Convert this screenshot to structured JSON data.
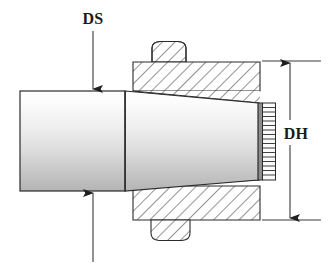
{
  "drawing": {
    "type": "engineering-cross-section",
    "title_visible": false,
    "background_color": "#ffffff",
    "line_color": "#2b2b2b",
    "hatch_color": "#4a4a4a",
    "shaft_fill_top": "#fdfdfd",
    "shaft_fill_bottom": "#b9b9b9",
    "labels": {
      "shaft_diameter": "DS",
      "hub_diameter": "DH"
    },
    "annotations": [
      {
        "name": "DS",
        "text": "DS",
        "description": "shaft diameter dimension with arrows pointing to top and bottom of shaft",
        "x": 93,
        "y": 18
      },
      {
        "name": "DH",
        "text": "DH",
        "description": "hub / housing diameter dimension with double arrow at right",
        "x": 296,
        "y": 133
      }
    ],
    "geometry": {
      "shaft_cylinder": {
        "x1": 20,
        "y1": 91,
        "x2": 125,
        "y2": 191
      },
      "shaft_taper": {
        "x1": 125,
        "y1": 91,
        "x2": 258,
        "y2_top": 103,
        "y2_bot": 180
      },
      "thread_block": {
        "x": 258,
        "y": 103,
        "w": 17,
        "h": 77,
        "teeth": 17
      },
      "housing_top": {
        "x": 133,
        "y": 62,
        "w": 127,
        "h": 29
      },
      "housing_bottom": {
        "x": 133,
        "y": 186,
        "w": 127,
        "h": 34
      },
      "boss_top": {
        "x": 152,
        "y": 42,
        "w": 34,
        "h": 20
      },
      "boss_bottom": {
        "x": 151,
        "y": 220,
        "w": 39,
        "h": 20
      },
      "dim_line_DH": {
        "x": 290,
        "y_top": 61,
        "y_bot": 220
      },
      "ext_line_top": {
        "x1": 262,
        "x2": 320,
        "y": 61
      },
      "ext_line_bottom": {
        "x1": 262,
        "x2": 320,
        "y": 220
      },
      "arrow_DS_top": {
        "x": 93,
        "y1": 30,
        "y2": 89
      },
      "arrow_DS_bottom": {
        "x": 93,
        "y1": 262,
        "y2": 193
      }
    }
  }
}
